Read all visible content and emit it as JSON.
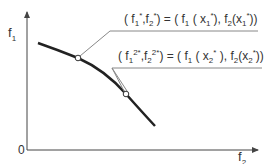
{
  "diagram": {
    "axes": {
      "y_label": "f",
      "y_label_sub": "1",
      "x_label": "f",
      "x_label_sub": "2",
      "origin_label": "0"
    },
    "points": [
      {
        "id": "point-1",
        "label_parts": [
          "( f",
          "1",
          "*",
          ",f",
          "2",
          "*",
          ") = ( f",
          "1",
          " ( x",
          "1",
          "*",
          "), f",
          "2",
          "(x",
          "1",
          "*",
          "))"
        ],
        "label_text": "(f1*, f2*) = (f1(x1*), f2(x1*))"
      },
      {
        "id": "point-2",
        "label_parts": [
          "( f",
          "1",
          "2*",
          ",f",
          "2",
          "2*",
          ") = ( f",
          "1",
          " ( x",
          "2",
          "*",
          " ), f",
          "2",
          "(x",
          "2",
          "*",
          "))"
        ],
        "label_text": "(f1 2*, f2 2*) = (f1(x2*), f2(x2*))"
      }
    ],
    "colors": {
      "curve": "#222222",
      "axis": "#444444",
      "leader": "#888888",
      "text": "#333333"
    }
  }
}
